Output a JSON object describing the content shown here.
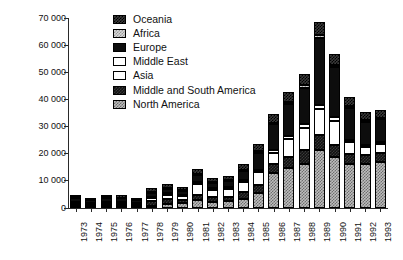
{
  "chart_data": {
    "type": "bar",
    "stacked": true,
    "title": "",
    "subtitle": "",
    "xlabel": "",
    "ylabel": "",
    "ylim": [
      0,
      70000
    ],
    "grid": false,
    "legend_position": "top-center",
    "categories": [
      "1973",
      "1974",
      "1975",
      "1976",
      "1977",
      "1978",
      "1979",
      "1980",
      "1981",
      "1982",
      "1983",
      "1984",
      "1985",
      "1986",
      "1987",
      "1988",
      "1989",
      "1990",
      "1991",
      "1992",
      "1993"
    ],
    "ytick_labels": [
      "70 000",
      "60 000",
      "50 000",
      "40 000",
      "30 000",
      "20 000",
      "10 000",
      "0"
    ],
    "ytick_values": [
      70000,
      60000,
      50000,
      40000,
      30000,
      20000,
      10000,
      0
    ],
    "series": [
      {
        "name": "North America",
        "pattern": "north-america",
        "values": [
          400,
          300,
          400,
          400,
          300,
          900,
          1400,
          1800,
          3000,
          2400,
          2600,
          3400,
          5600,
          12800,
          14600,
          16400,
          21400,
          18800,
          16200,
          16400,
          17000
        ]
      },
      {
        "name": "Middle and South America",
        "pattern": "middle-south-america",
        "values": [
          600,
          400,
          700,
          600,
          500,
          1600,
          1900,
          1300,
          1800,
          1500,
          1600,
          2400,
          3000,
          3600,
          4200,
          4800,
          5600,
          4600,
          3600,
          3200,
          3400
        ]
      },
      {
        "name": "Asia",
        "pattern": "asia",
        "values": [
          900,
          700,
          900,
          900,
          700,
          1200,
          1500,
          1200,
          4000,
          2700,
          2800,
          3800,
          4600,
          4000,
          6600,
          8200,
          9400,
          8600,
          4400,
          3000,
          3200
        ]
      },
      {
        "name": "Middle East",
        "pattern": "middle-east",
        "values": [
          400,
          300,
          400,
          400,
          300,
          500,
          600,
          500,
          700,
          600,
          600,
          800,
          900,
          1000,
          1200,
          1400,
          1600,
          1400,
          1000,
          800,
          900
        ]
      },
      {
        "name": "Europe",
        "pattern": "europe",
        "values": [
          1400,
          1100,
          1300,
          1300,
          1000,
          1500,
          1700,
          1500,
          2600,
          2100,
          2300,
          3200,
          6200,
          9400,
          11600,
          13600,
          24600,
          18400,
          11800,
          8400,
          8200
        ]
      },
      {
        "name": "Africa",
        "pattern": "africa",
        "values": [
          200,
          150,
          200,
          200,
          150,
          300,
          350,
          300,
          500,
          400,
          400,
          500,
          600,
          700,
          800,
          900,
          1100,
          900,
          700,
          600,
          600
        ]
      },
      {
        "name": "Oceania",
        "pattern": "oceania",
        "values": [
          900,
          700,
          900,
          900,
          700,
          1200,
          1400,
          1200,
          1900,
          1500,
          1600,
          2100,
          2700,
          3100,
          3700,
          4200,
          4800,
          4000,
          3200,
          2800,
          2800
        ]
      }
    ],
    "totals": [
      4800,
      3650,
      4800,
      4700,
      3650,
      7200,
      8850,
      7800,
      14500,
      11200,
      11900,
      16200,
      23600,
      34600,
      42700,
      49500,
      68500,
      56700,
      40900,
      35200,
      36100
    ],
    "legend_entries": [
      {
        "label": "Oceania",
        "pattern": "oceania"
      },
      {
        "label": "Africa",
        "pattern": "africa"
      },
      {
        "label": "Europe",
        "pattern": "europe"
      },
      {
        "label": "Middle East",
        "pattern": "middle-east"
      },
      {
        "label": "Asia",
        "pattern": "asia"
      },
      {
        "label": "Middle and South America",
        "pattern": "middle-south-america"
      },
      {
        "label": "North America",
        "pattern": "north-america"
      }
    ]
  }
}
